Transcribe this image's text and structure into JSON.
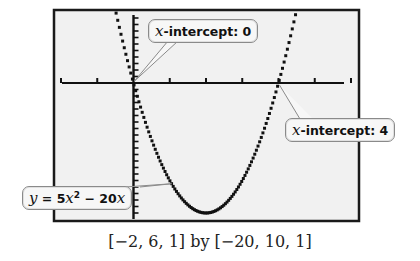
{
  "chart_data": {
    "type": "line",
    "title": "",
    "function": "y = 5x^2 - 20x",
    "series": [
      {
        "name": "y = 5x^2 - 20x",
        "x": [
          -0.6,
          -0.4,
          -0.2,
          0,
          0.5,
          1,
          1.5,
          2,
          2.5,
          3,
          3.5,
          4,
          4.4,
          4.6
        ],
        "y": [
          9.8,
          8.8,
          4.2,
          0,
          -7.75,
          -15,
          -18.75,
          -20,
          -18.75,
          -15,
          -8.75,
          0,
          9.2,
          13.8
        ]
      }
    ],
    "xlim": [
      -2,
      6
    ],
    "ylim": [
      -20,
      10
    ],
    "xscale": 1,
    "yscale": 1,
    "grid": false,
    "annotations": [
      {
        "text_italic": "x",
        "text": "-intercept: 0",
        "x": 0,
        "y": 0
      },
      {
        "text_italic": "x",
        "text": "-intercept: 4",
        "x": 4,
        "y": 0
      },
      {
        "text": "y = 5x² − 20x",
        "x": 0.6,
        "y": -9
      }
    ],
    "window_caption": "[−2, 6, 1] by [−20, 10, 1]"
  },
  "labels": {
    "intercept0_var": "x",
    "intercept0_text": "-intercept: 0",
    "intercept4_var": "x",
    "intercept4_text": "-intercept: 4",
    "eq_y": "y",
    "eq_mid": " = 5",
    "eq_x": "x",
    "eq_sup": "2",
    "eq_tail": " − 20",
    "eq_x2": "x",
    "caption": "[−2, 6, 1] by [−20, 10, 1]"
  }
}
